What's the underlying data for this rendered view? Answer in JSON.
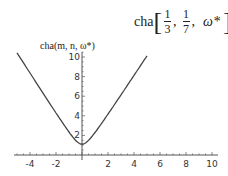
{
  "title": {
    "func": "cha",
    "arg1_num": "1",
    "arg1_den": "3",
    "arg2_num": "1",
    "arg2_den": "7",
    "arg3": "ω*",
    "sep": ",",
    "open": "[",
    "close": "]"
  },
  "ylabel": "cha(m, n, ω*)",
  "colors": {
    "curve": "#444444",
    "axis": "#555555"
  },
  "chart_data": {
    "type": "line",
    "xlabel": "",
    "ylabel": "cha(m, n, ω*)",
    "x_ticks": [
      -4,
      -2,
      2,
      4,
      6,
      8,
      10
    ],
    "y_ticks": [
      2,
      4,
      6,
      8,
      10
    ],
    "xlim": [
      -5,
      10
    ],
    "ylim": [
      0,
      10.5
    ],
    "grid": false,
    "series": [
      {
        "name": "cha(1/3, 1/7, ω*)",
        "x": [
          -5,
          -4,
          -3,
          -2,
          -1,
          0,
          1,
          2,
          3,
          4,
          5
        ],
        "y": [
          10.4,
          8.3,
          6.3,
          4.3,
          2.4,
          1.1,
          2.3,
          4.2,
          6.1,
          8.1,
          10.1
        ]
      }
    ]
  }
}
